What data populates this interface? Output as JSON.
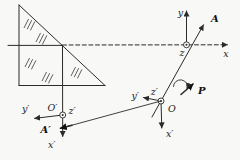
{
  "labels": {
    "main_frame": {
      "x": "x",
      "y": "y",
      "z": "z",
      "vector_a": "A"
    },
    "o_frame": {
      "origin": "O",
      "x_prime": "x′",
      "y_prime": "y′",
      "z_prime": "z′",
      "vector_p": "P"
    },
    "image_frame": {
      "origin": "O′",
      "x_prime": "x′",
      "y_prime": "y′",
      "z_prime": "z′",
      "vector_a_prime": "A′"
    }
  },
  "colors": {
    "line": "#2b2b2b",
    "background": "#f8f8f6",
    "text": "#1c1c1c"
  }
}
